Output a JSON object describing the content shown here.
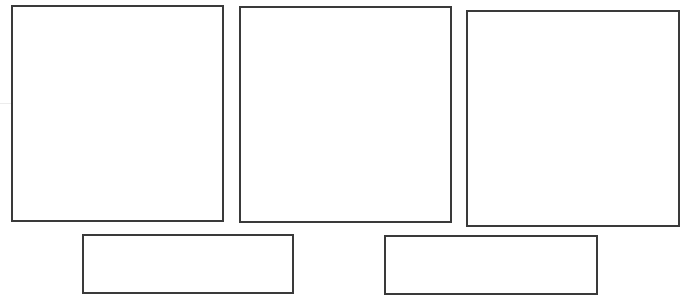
{
  "frames": [
    {
      "name": "frame-top-left",
      "label": ""
    },
    {
      "name": "frame-top-middle",
      "label": ""
    },
    {
      "name": "frame-top-right",
      "label": ""
    },
    {
      "name": "frame-bottom-left",
      "label": ""
    },
    {
      "name": "frame-bottom-right",
      "label": ""
    }
  ],
  "colors": {
    "border": "#3a3a3a",
    "background": "#ffffff"
  }
}
